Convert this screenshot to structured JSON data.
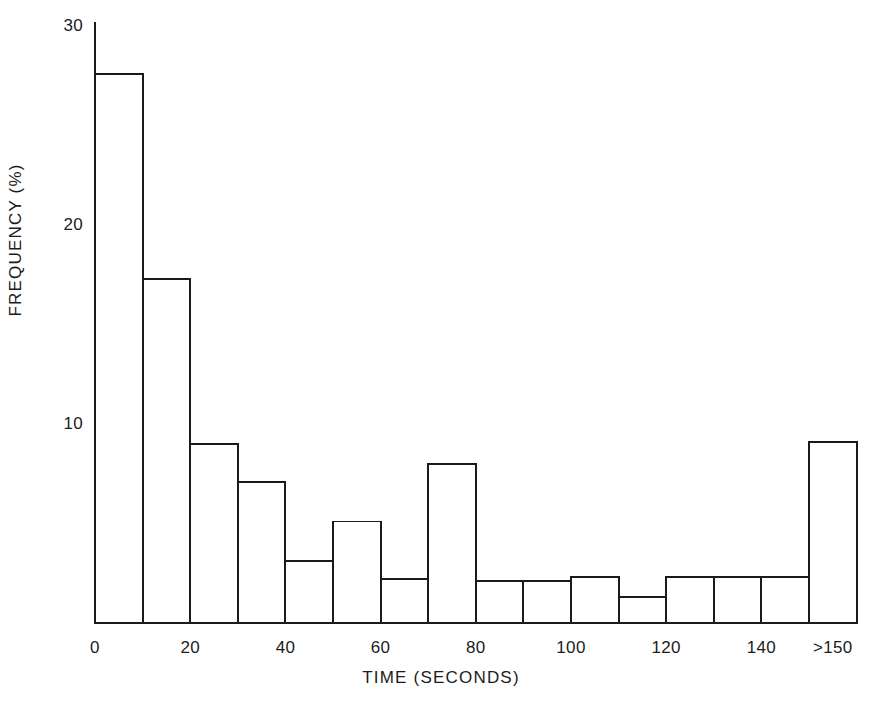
{
  "chart_data": {
    "type": "bar",
    "title": "",
    "subtitle": "",
    "xlabel": "TIME (SECONDS)",
    "ylabel": "FREQUENCY (%)",
    "xlim": [
      0,
      160
    ],
    "ylim": [
      0,
      30
    ],
    "grid": false,
    "legend": null,
    "bin_width": 10,
    "x_tick_labels": [
      "0",
      "20",
      "40",
      "60",
      "80",
      "100",
      "120",
      "140",
      ">150"
    ],
    "x_tick_values": [
      0,
      20,
      40,
      60,
      80,
      100,
      120,
      140,
      155
    ],
    "y_tick_labels": [
      "30",
      "20",
      "10"
    ],
    "y_tick_values": [
      30,
      20,
      10
    ],
    "categories": [
      "0-10",
      "10-20",
      "20-30",
      "30-40",
      "40-50",
      "50-60",
      "60-70",
      "70-80",
      "80-90",
      "90-100",
      "100-110",
      "110-120",
      "120-130",
      "130-140",
      "140-150",
      ">150"
    ],
    "bin_starts": [
      0,
      10,
      20,
      30,
      40,
      50,
      60,
      70,
      80,
      90,
      100,
      110,
      120,
      130,
      140,
      150
    ],
    "values": [
      27.6,
      17.3,
      9.0,
      7.1,
      3.1,
      5.1,
      2.2,
      8.0,
      2.1,
      2.1,
      2.3,
      1.3,
      2.3,
      2.3,
      2.3,
      9.1
    ],
    "series": [
      {
        "name": "Frequency",
        "values": [
          27.6,
          17.3,
          9.0,
          7.1,
          3.1,
          5.1,
          2.2,
          8.0,
          2.1,
          2.1,
          2.3,
          1.3,
          2.3,
          2.3,
          2.3,
          9.1
        ]
      }
    ],
    "style": {
      "bar_fill": "#ffffff",
      "bar_stroke": "#1a1a1a",
      "axis_color": "#1a1a1a",
      "background": "#ffffff"
    }
  }
}
